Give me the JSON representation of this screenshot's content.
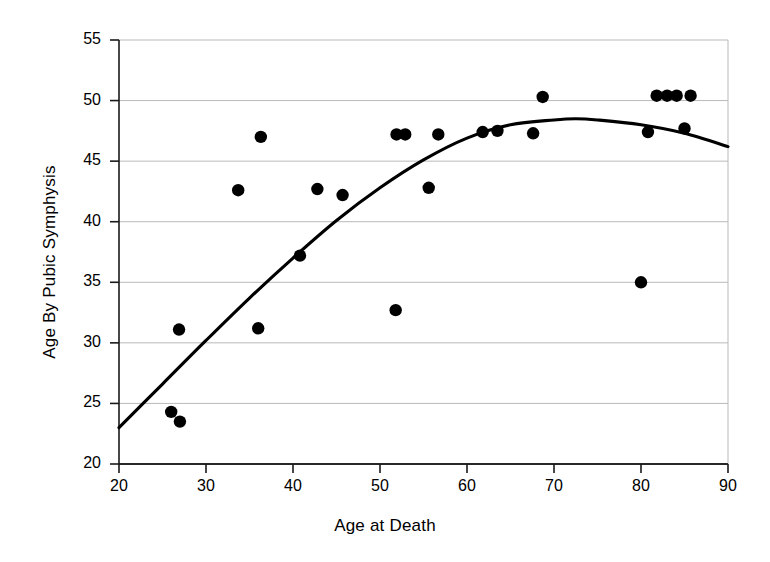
{
  "chart_data": {
    "type": "scatter",
    "title": "",
    "xlabel": "Age at Death",
    "ylabel": "Age By Pubic Symphysis",
    "xlim": [
      20,
      90
    ],
    "ylim": [
      20,
      55
    ],
    "xticks": [
      20,
      30,
      40,
      50,
      60,
      70,
      80,
      90
    ],
    "yticks": [
      20,
      25,
      30,
      35,
      40,
      45,
      50,
      55
    ],
    "grid": "horizontal",
    "legend": "none",
    "marker_color": "#000000",
    "line_color": "#000000",
    "points": [
      {
        "x": 26.0,
        "y": 24.3
      },
      {
        "x": 27.0,
        "y": 23.5
      },
      {
        "x": 26.9,
        "y": 31.1
      },
      {
        "x": 33.7,
        "y": 42.6
      },
      {
        "x": 36.0,
        "y": 31.2
      },
      {
        "x": 36.3,
        "y": 47.0
      },
      {
        "x": 40.8,
        "y": 37.2
      },
      {
        "x": 42.8,
        "y": 42.7
      },
      {
        "x": 45.7,
        "y": 42.2
      },
      {
        "x": 51.8,
        "y": 32.7
      },
      {
        "x": 51.9,
        "y": 47.2
      },
      {
        "x": 52.9,
        "y": 47.2
      },
      {
        "x": 55.6,
        "y": 42.8
      },
      {
        "x": 56.7,
        "y": 47.2
      },
      {
        "x": 61.8,
        "y": 47.4
      },
      {
        "x": 63.5,
        "y": 47.5
      },
      {
        "x": 67.6,
        "y": 47.3
      },
      {
        "x": 68.7,
        "y": 50.3
      },
      {
        "x": 80.0,
        "y": 35.0
      },
      {
        "x": 80.8,
        "y": 47.4
      },
      {
        "x": 81.8,
        "y": 50.4
      },
      {
        "x": 83.0,
        "y": 50.4
      },
      {
        "x": 84.1,
        "y": 50.4
      },
      {
        "x": 85.0,
        "y": 47.7
      },
      {
        "x": 85.7,
        "y": 50.4
      }
    ],
    "fit_curve": {
      "name": "quadratic fit",
      "x": [
        20,
        25,
        30,
        35,
        40,
        45,
        50,
        55,
        60,
        65,
        70,
        72.5,
        75,
        80,
        85,
        90
      ],
      "y": [
        23.0,
        26.6,
        30.2,
        33.7,
        37.0,
        40.1,
        42.8,
        45.1,
        46.9,
        48.0,
        48.4,
        48.5,
        48.4,
        48.0,
        47.3,
        46.2
      ]
    }
  },
  "axes": {
    "x_title": "Age at Death",
    "y_title": "Age By Pubic Symphysis",
    "x_tick_labels": [
      "20",
      "30",
      "40",
      "50",
      "60",
      "70",
      "80",
      "90"
    ],
    "y_tick_labels": [
      "20",
      "25",
      "30",
      "35",
      "40",
      "45",
      "50",
      "55"
    ]
  }
}
